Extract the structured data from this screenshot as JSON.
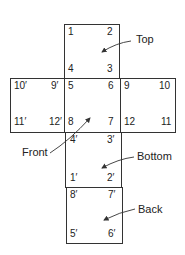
{
  "faces": {
    "top": {
      "caption": "Top",
      "corners": {
        "tl": "1",
        "tr": "2",
        "bl": "4",
        "br": "3"
      }
    },
    "left": {
      "corners": {
        "tl": "10′",
        "tr": "9′",
        "bl": "11′",
        "br": "12′"
      }
    },
    "front": {
      "caption": "Front",
      "corners": {
        "tl": "5",
        "tr": "6",
        "bl": "8",
        "br": "7"
      }
    },
    "right": {
      "corners": {
        "tl": "9",
        "tr": "10",
        "bl": "12",
        "br": "11"
      }
    },
    "bottom": {
      "caption": "Bottom",
      "corners": {
        "tl": "4′",
        "tr": "3′",
        "bl": "1′",
        "br": "2′"
      }
    },
    "back": {
      "caption": "Back",
      "corners": {
        "tl": "8′",
        "tr": "7′",
        "bl": "5′",
        "br": "6′"
      }
    }
  },
  "colors": {
    "line": "#333333",
    "text": "#222222",
    "background": "#ffffff"
  }
}
